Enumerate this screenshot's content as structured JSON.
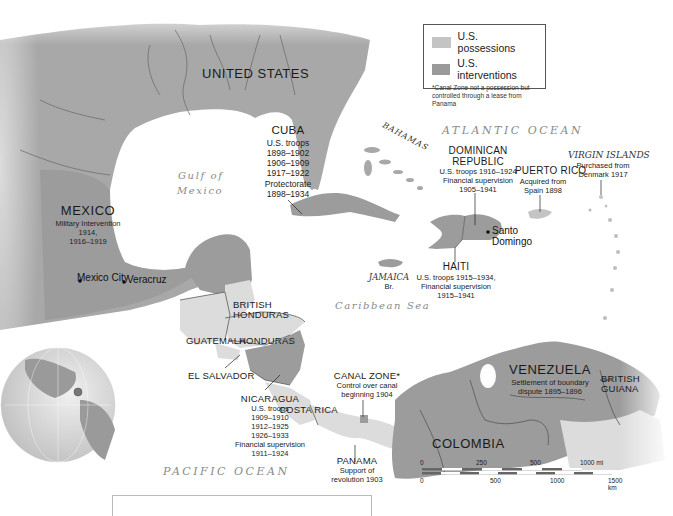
{
  "legend": {
    "items": [
      {
        "label": "U.S. possessions",
        "color": "#c4c4c4"
      },
      {
        "label": "U.S. interventions",
        "color": "#9a9a9a"
      }
    ],
    "note": "*Canal Zone not a possession but controlled through a lease from Panama"
  },
  "colors": {
    "possession": "#cfcfcf",
    "intervention": "#9c9c9c",
    "land": "#a8a8a8",
    "land_light": "#dcdcdc",
    "water": "#ffffff",
    "border": "#5a5a5a",
    "river": "#6e6e6e"
  },
  "oceans": {
    "atlantic": "ATLANTIC OCEAN",
    "pacific": "PACIFIC OCEAN",
    "gulf_line1": "Gulf of",
    "gulf_line2": "Mexico",
    "caribbean": "Caribbean Sea"
  },
  "countries": {
    "united_states": "UNITED STATES",
    "bahamas": "BAHAMAS",
    "cuba": {
      "name": "CUBA",
      "notes": [
        "U.S. troops",
        "1898–1902",
        "1906–1909",
        "1917–1922",
        "Protectorate",
        "1898–1934"
      ]
    },
    "dominican_republic": {
      "name_line1": "DOMINICAN",
      "name_line2": "REPUBLIC",
      "notes": [
        "U.S. troops 1916–1924",
        "Financial supervision",
        "1905–1941"
      ]
    },
    "puerto_rico": {
      "name": "PUERTO RICO",
      "notes": [
        "Acquired from",
        "Spain 1898"
      ]
    },
    "virgin_islands": {
      "name": "VIRGIN ISLANDS",
      "notes": [
        "Purchased from",
        "Denmark 1917"
      ]
    },
    "haiti": {
      "name": "HAITI",
      "notes": [
        "U.S. troops 1915–1934,",
        "Financial supervision",
        "1915–1941"
      ]
    },
    "jamaica": {
      "name": "JAMAICA",
      "note": "Br."
    },
    "mexico": {
      "name": "MEXICO",
      "notes": [
        "Military Intervention",
        "1914,",
        "1916–1919"
      ]
    },
    "british_honduras": {
      "name_line1": "BRITISH",
      "name_line2": "HONDURAS"
    },
    "guatemala": "GUATEMALA",
    "honduras": "HONDURAS",
    "el_salvador": "EL SALVADOR",
    "nicaragua": {
      "name": "NICARAGUA",
      "notes": [
        "U.S. troops",
        "1909–1910",
        "1912–1925",
        "1926–1933",
        "Financial supervision",
        "1911–1924"
      ]
    },
    "costa_rica": "COSTA RICA",
    "canal_zone": {
      "name": "CANAL ZONE*",
      "notes": [
        "Control over canal",
        "beginning 1904"
      ]
    },
    "panama": {
      "name": "PANAMA",
      "notes": [
        "Support of",
        "revolution 1903"
      ]
    },
    "venezuela": {
      "name": "VENEZUELA",
      "notes": [
        "Settlement of boundary",
        "dispute 1895–1896"
      ]
    },
    "british_guiana": {
      "name_line1": "BRITISH",
      "name_line2": "GUIANA"
    },
    "colombia": "COLOMBIA"
  },
  "cities": {
    "mexico_city": "Mexico City",
    "veracruz": "Veracruz",
    "santo_domingo_line1": "Santo",
    "santo_domingo_line2": "Domingo"
  },
  "scale": {
    "mi_ticks": [
      "0",
      "250",
      "500",
      "1000 mi"
    ],
    "km_ticks": [
      "0",
      "500",
      "1000",
      "1500 km"
    ]
  }
}
